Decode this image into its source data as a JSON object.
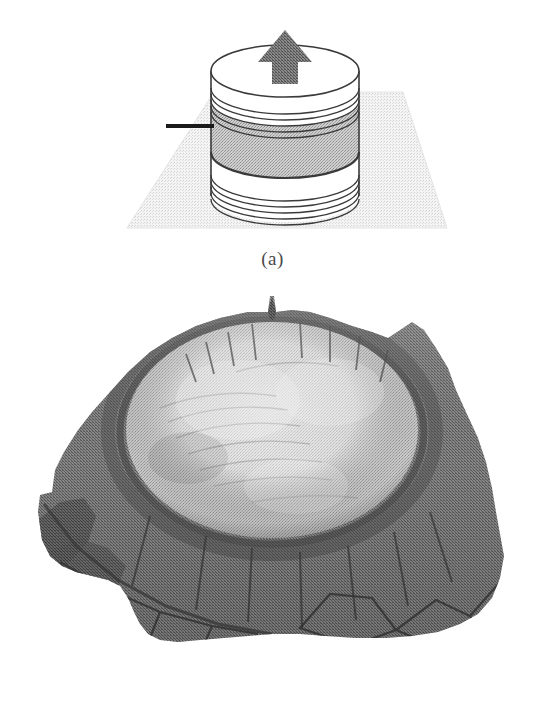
{
  "figure": {
    "background_color": "#ffffff",
    "width": 545,
    "height": 708,
    "panel_count": 2
  },
  "panel_a": {
    "caption": "(a)",
    "description": "Schematic of a layered cylindrical disc resting on a ground plane with an upward arrow on its top face",
    "elements": {
      "ground_plane_label": "ground-plane",
      "cylinder_label": "layered-cylinder",
      "arrow_label": "up-arrow",
      "tick_label": "left-tick-mark"
    },
    "colors": {
      "ground_plane": "#e9e9e9",
      "ground_plane_edge": "#d8d8d8",
      "disc_face": "#ffffff",
      "band_fill": "#b4b4b4",
      "arrow_fill": "#707070",
      "outline": "#3a3a3a",
      "tick": "#1a1a1a"
    },
    "geometry": {
      "cylinder_center_x": 285,
      "top_ellipse_cy": 71,
      "ellipse_rx": 74,
      "ellipse_ry": 26,
      "ground_plane_points": "127,228 214,92 403,92 447,228",
      "upper_line_count": 5,
      "lower_line_count": 5,
      "gray_band_top_y": 100,
      "gray_band_bottom_y": 152,
      "white_band_top_y": 160,
      "bottom_ellipse_cy": 196
    },
    "arrow": {
      "shaft_half_width": 13,
      "head_half_width": 27,
      "tip_y": 30,
      "base_y": 84
    }
  },
  "panel_b": {
    "caption": "(b)",
    "description": "Halftone grayscale 3D rendered surface of a crater: rugged dark outer terrain surrounding a bright smooth elliptical inner basin, with a notch spike on the upper rim and faceted blocks in the foreground",
    "elements": {
      "terrain_label": "terrain-surface",
      "basin_label": "crater-basin",
      "rim_label": "crater-rim",
      "notch_label": "rim-notch-spike",
      "foreground_label": "foreground-blocks"
    },
    "colors": {
      "terrain_dark": "#6f6f6f",
      "terrain_mid": "#7e7e7e",
      "terrain_shadow": "#4a4a4a",
      "rim_highlight": "#9a9a9a",
      "basin_bright": "#d2d2d2",
      "basin_mid": "#b6b6b6",
      "basin_edge": "#8a8a8a",
      "crack_line": "#3c3c3c"
    },
    "geometry": {
      "terrain_outline": "38,512 40,495 52,492 55,470 64,452 78,430 92,412 110,392 128,372 150,352 172,338 196,326 220,318 248,312 268,312 272,318 278,312 292,310 310,312 330,318 352,326 372,332 388,338 400,330 412,322 424,330 436,348 448,368 456,390 466,412 478,438 486,462 492,488 496,512 500,534 504,556 500,578 492,598 478,614 460,624 438,632 412,636 386,638 356,638 326,636 300,634 272,634 248,636 224,638 200,640 178,642 160,640 148,634 140,624 134,612 128,598 120,586 108,580 92,576 76,572 62,566 50,556 42,540",
      "basin_ellipse_cx": 272,
      "basin_ellipse_cy": 430,
      "basin_ellipse_rx": 146,
      "basin_ellipse_ry": 108,
      "notch_x": 272,
      "notch_y": 310
    }
  }
}
